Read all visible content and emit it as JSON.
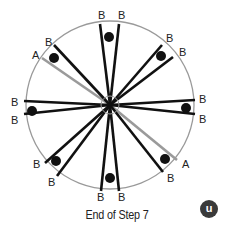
{
  "diagram": {
    "center": [
      110,
      105
    ],
    "radius": 84,
    "hub_radius": 9,
    "colors": {
      "circle": "#9a9a9a",
      "b_line": "#111111",
      "a_line": "#9a9a9a",
      "dot": "#111111"
    },
    "lines": [
      {
        "type": "B",
        "x": 100,
        "y": 24,
        "label": "B",
        "lx": 98,
        "ly": 19
      },
      {
        "type": "B",
        "x": 119,
        "y": 24,
        "label": "B",
        "lx": 118,
        "ly": 19
      },
      {
        "type": "B",
        "x": 162,
        "y": 45,
        "label": "B",
        "lx": 166,
        "ly": 42
      },
      {
        "type": "B",
        "x": 173,
        "y": 57,
        "label": "B",
        "lx": 179,
        "ly": 56
      },
      {
        "type": "B",
        "x": 195,
        "y": 100,
        "label": "B",
        "lx": 199,
        "ly": 103
      },
      {
        "type": "B",
        "x": 195,
        "y": 114,
        "label": "B",
        "lx": 199,
        "ly": 123
      },
      {
        "type": "A",
        "x": 177,
        "y": 160,
        "label": "A",
        "lx": 182,
        "ly": 168
      },
      {
        "type": "B",
        "x": 163,
        "y": 172,
        "label": "B",
        "lx": 167,
        "ly": 182
      },
      {
        "type": "B",
        "x": 119,
        "y": 191,
        "label": "B",
        "lx": 118,
        "ly": 201
      },
      {
        "type": "B",
        "x": 101,
        "y": 191,
        "label": "B",
        "lx": 97,
        "ly": 201
      },
      {
        "type": "B",
        "x": 57,
        "y": 176,
        "label": "B",
        "lx": 48,
        "ly": 186
      },
      {
        "type": "B",
        "x": 45,
        "y": 163,
        "label": "B",
        "lx": 33,
        "ly": 168
      },
      {
        "type": "B",
        "x": 24,
        "y": 114,
        "label": "B",
        "lx": 11,
        "ly": 124
      },
      {
        "type": "B",
        "x": 24,
        "y": 101,
        "label": "B",
        "lx": 11,
        "ly": 106
      },
      {
        "type": "A",
        "x": 42,
        "y": 58,
        "label": "A",
        "lx": 32,
        "ly": 59
      },
      {
        "type": "B",
        "x": 54,
        "y": 45,
        "label": "B",
        "lx": 45,
        "ly": 46
      }
    ],
    "dots": [
      {
        "x": 109,
        "y": 37
      },
      {
        "x": 161,
        "y": 56
      },
      {
        "x": 186,
        "y": 108
      },
      {
        "x": 165,
        "y": 159
      },
      {
        "x": 110,
        "y": 178
      },
      {
        "x": 56,
        "y": 161
      },
      {
        "x": 32,
        "y": 111
      },
      {
        "x": 54,
        "y": 58
      }
    ],
    "dot_radius": 5
  },
  "caption": "End of Step 7",
  "logo": {
    "glyph": "u",
    "color": "#3a3a3a"
  }
}
